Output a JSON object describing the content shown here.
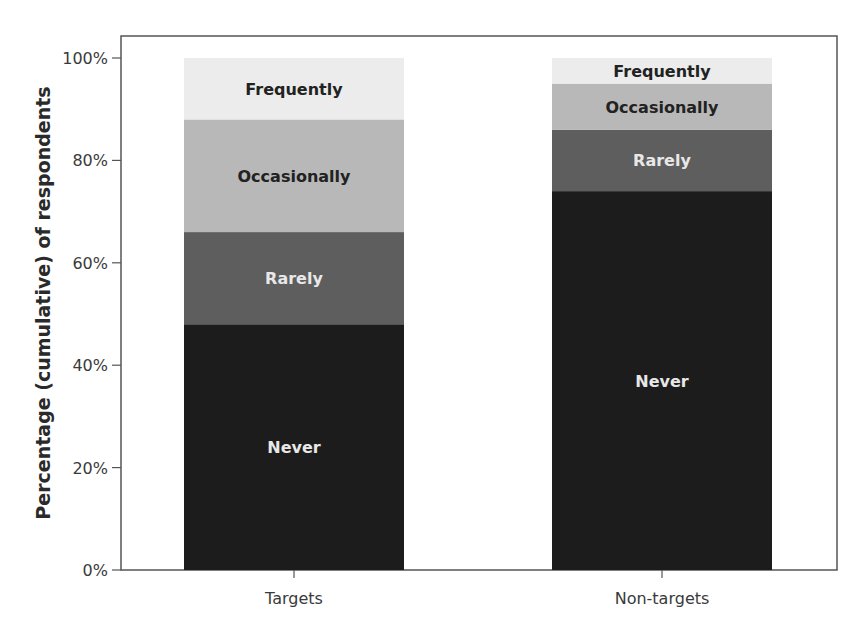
{
  "chart_data": {
    "type": "bar",
    "stacked": true,
    "cumulative": true,
    "title": "",
    "xlabel": "",
    "ylabel": "Percentage (cumulative) of respondents",
    "ylim": [
      0,
      100
    ],
    "yticks": [
      "0%",
      "20%",
      "40%",
      "60%",
      "80%",
      "100%"
    ],
    "grid": false,
    "legend": "inline segment labels",
    "categories": [
      "Targets",
      "Non-targets"
    ],
    "series": [
      {
        "name": "Never",
        "values": [
          48,
          74
        ],
        "color": "#1c1c1c",
        "label_color": "#e8e8e8"
      },
      {
        "name": "Rarely",
        "values": [
          18,
          12
        ],
        "color": "#5e5e5e",
        "label_color": "#e8e8e8"
      },
      {
        "name": "Occasionally",
        "values": [
          22,
          9
        ],
        "color": "#b8b8b8",
        "label_color": "#222222"
      },
      {
        "name": "Frequently",
        "values": [
          12,
          5
        ],
        "color": "#ececec",
        "label_color": "#222222"
      }
    ],
    "cumulative_tops": {
      "Targets": {
        "Never": 48,
        "Rarely": 66,
        "Occasionally": 88,
        "Frequently": 100
      },
      "Non-targets": {
        "Never": 74,
        "Rarely": 86,
        "Occasionally": 95,
        "Frequently": 100
      }
    }
  }
}
